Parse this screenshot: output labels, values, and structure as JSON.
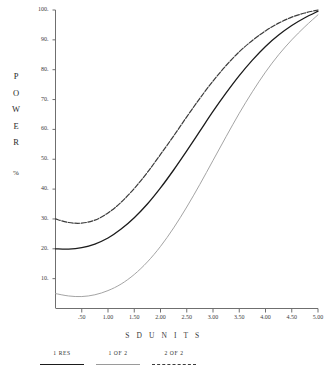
{
  "chart_data": {
    "type": "line",
    "title": "",
    "xlabel": "S D   U N I T S",
    "ylabel": "P O W E R %",
    "ylabel_letters": [
      "P",
      "O",
      "W",
      "E",
      "R"
    ],
    "ylabel_unit": "%",
    "xlim": [
      0.0,
      5.0
    ],
    "ylim": [
      0.0,
      100.0
    ],
    "grid": false,
    "legend_position": "bottom-left",
    "xtick_labels": [
      ".50",
      "1.00",
      "1.50",
      "2.00",
      "2.50",
      "3.00",
      "3.50",
      "4.00",
      "4.50",
      "5.00"
    ],
    "xtick_values": [
      0.5,
      1.0,
      1.5,
      2.0,
      2.5,
      3.0,
      3.5,
      4.0,
      4.5,
      5.0
    ],
    "ytick_labels": [
      "10.",
      "20.",
      "30.",
      "40.",
      "50.",
      "60.",
      "70.",
      "80.",
      "90.",
      "100."
    ],
    "ytick_values": [
      10,
      20,
      30,
      40,
      50,
      60,
      70,
      80,
      90,
      100
    ],
    "x": [
      0.0,
      0.25,
      0.5,
      0.75,
      1.0,
      1.25,
      1.5,
      1.75,
      2.0,
      2.25,
      2.5,
      2.75,
      3.0,
      3.25,
      3.5,
      3.75,
      4.0,
      4.25,
      4.5,
      4.75,
      5.0
    ],
    "series": [
      {
        "name": "2 OF 2",
        "style": "dashed",
        "color": "#3c3c3c",
        "values": [
          30.0,
          28.8,
          28.6,
          29.6,
          32.0,
          35.6,
          40.2,
          45.6,
          51.6,
          57.8,
          64.2,
          70.4,
          76.2,
          81.4,
          86.0,
          89.8,
          93.0,
          95.6,
          97.6,
          99.0,
          100.0
        ]
      },
      {
        "name": "1 RES",
        "style": "solid",
        "color": "#1b1b1b",
        "values": [
          20.0,
          19.9,
          20.4,
          21.6,
          23.6,
          26.6,
          30.4,
          35.0,
          40.4,
          46.4,
          52.8,
          59.4,
          66.0,
          72.2,
          78.0,
          83.2,
          87.8,
          91.6,
          94.8,
          97.4,
          99.6
        ]
      },
      {
        "name": "1 OF 2",
        "style": "light",
        "color": "#9a9a9a",
        "values": [
          5.0,
          4.2,
          4.0,
          4.6,
          6.0,
          8.2,
          11.4,
          15.6,
          20.8,
          27.0,
          34.0,
          41.6,
          49.6,
          57.6,
          65.4,
          72.6,
          79.2,
          85.0,
          90.0,
          94.4,
          98.4
        ]
      }
    ]
  },
  "legend": {
    "entries": [
      {
        "label": "1 RES",
        "style": "solid"
      },
      {
        "label": "1 OF 2",
        "style": "light"
      },
      {
        "label": "2 OF 2",
        "style": "dash"
      }
    ]
  }
}
